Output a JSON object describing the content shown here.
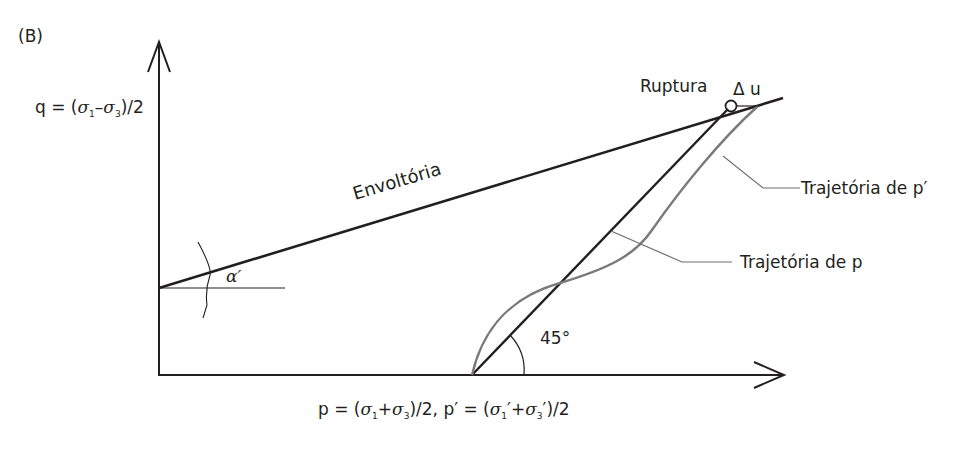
{
  "figure": {
    "panel_label": "(B)",
    "y_axis_label": {
      "prefix": "q = (",
      "sigma1": "σ",
      "sub1": "1",
      "minus": "–",
      "sigma3": "σ",
      "sub3": "3",
      "suffix": ")/2"
    },
    "x_axis_label": {
      "part1": "p = (",
      "s1": "σ",
      "sub1": "1",
      "plus1": "+",
      "s3": "σ",
      "sub3": "3",
      "part2": ")/2, p′ = (",
      "s1p": "σ",
      "sub1p": "1",
      "prime1": "′",
      "plus2": "+",
      "s3p": "σ",
      "sub3p": "3",
      "prime3": "′",
      "part3": ")/2"
    },
    "envelope_label": "Envoltória",
    "rupture_label": "Ruptura",
    "delta_u_label": "Δ u",
    "alpha_label": "α′",
    "angle_label": "45°",
    "path_p_effective_label": "Trajetória de p′",
    "path_p_total_label": "Trajetória de p"
  },
  "colors": {
    "ink": "#231f20",
    "effective_path": "#7a7a7a",
    "leader": "#6d6e71"
  }
}
